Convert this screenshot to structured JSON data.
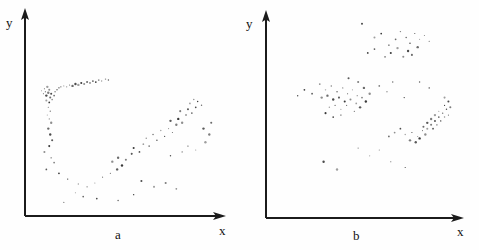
{
  "figure": {
    "background_color": "#fefefe",
    "ink_color": "#1b1b1b",
    "caption_a": "a",
    "caption_b": "b"
  },
  "panels": [
    {
      "id": "a",
      "caption": "a",
      "y_axis_label": "y",
      "x_axis_label": "x",
      "axis": {
        "origin_x": 25,
        "origin_y": 216,
        "x_end": 225,
        "y_end": 10
      }
    },
    {
      "id": "b",
      "caption": "b",
      "y_axis_label": "y",
      "x_axis_label": "x",
      "axis": {
        "origin_x": 26,
        "origin_y": 218,
        "x_end": 224,
        "y_end": 12
      }
    }
  ],
  "chart_data": [
    {
      "type": "scatter",
      "title": "a",
      "xlabel": "x",
      "ylabel": "y",
      "grid": false,
      "legend": "none",
      "axes_style": "arrow-axes-no-ticks",
      "xlim": [
        0,
        200
      ],
      "ylim": [
        0,
        206
      ],
      "description": "Sparse scattered points: a dense arching band in the upper-left rising to the right, plus a looser diagonal band of points in the lower-right quadrant.",
      "series": [
        {
          "name": "points",
          "points": [
            [
              17,
              129
            ],
            [
              19,
              126
            ],
            [
              20,
              131
            ],
            [
              21,
              128
            ],
            [
              22,
              124
            ],
            [
              23,
              133
            ],
            [
              24,
              127
            ],
            [
              25,
              130
            ],
            [
              26,
              122
            ],
            [
              27,
              126
            ],
            [
              22,
              119
            ],
            [
              25,
              117
            ],
            [
              28,
              120
            ],
            [
              30,
              124
            ],
            [
              31,
              128
            ],
            [
              33,
              130
            ],
            [
              35,
              132
            ],
            [
              37,
              133
            ],
            [
              40,
              134
            ],
            [
              43,
              133
            ],
            [
              46,
              135
            ],
            [
              49,
              134
            ],
            [
              52,
              136
            ],
            [
              55,
              135
            ],
            [
              58,
              137
            ],
            [
              61,
              136
            ],
            [
              64,
              138
            ],
            [
              67,
              137
            ],
            [
              70,
              139
            ],
            [
              73,
              138
            ],
            [
              76,
              140
            ],
            [
              79,
              139
            ],
            [
              83,
              141
            ],
            [
              86,
              140
            ],
            [
              24,
              112
            ],
            [
              26,
              108
            ],
            [
              23,
              104
            ],
            [
              25,
              100
            ],
            [
              27,
              96
            ],
            [
              24,
              90
            ],
            [
              26,
              84
            ],
            [
              28,
              78
            ],
            [
              25,
              72
            ],
            [
              20,
              66
            ],
            [
              27,
              60
            ],
            [
              30,
              55
            ],
            [
              22,
              48
            ],
            [
              35,
              44
            ],
            [
              44,
              38
            ],
            [
              55,
              33
            ],
            [
              64,
              30
            ],
            [
              72,
              34
            ],
            [
              80,
              40
            ],
            [
              88,
              44
            ],
            [
              95,
              48
            ],
            [
              100,
              52
            ],
            [
              90,
              56
            ],
            [
              96,
              60
            ],
            [
              104,
              58
            ],
            [
              110,
              64
            ],
            [
              112,
              70
            ],
            [
              118,
              66
            ],
            [
              122,
              74
            ],
            [
              128,
              72
            ],
            [
              125,
              80
            ],
            [
              132,
              84
            ],
            [
              136,
              78
            ],
            [
              140,
              88
            ],
            [
              144,
              82
            ],
            [
              148,
              90
            ],
            [
              152,
              86
            ],
            [
              156,
              94
            ],
            [
              150,
              98
            ],
            [
              158,
              100
            ],
            [
              162,
              96
            ],
            [
              166,
              104
            ],
            [
              160,
              108
            ],
            [
              168,
              110
            ],
            [
              172,
              106
            ],
            [
              176,
              112
            ],
            [
              170,
              116
            ],
            [
              178,
              118
            ],
            [
              174,
              120
            ],
            [
              182,
              114
            ],
            [
              150,
              62
            ],
            [
              162,
              66
            ],
            [
              168,
              72
            ],
            [
              176,
              68
            ],
            [
              186,
              76
            ],
            [
              190,
              84
            ],
            [
              184,
              90
            ],
            [
              192,
              96
            ],
            [
              120,
              36
            ],
            [
              133,
              30
            ],
            [
              145,
              34
            ],
            [
              156,
              28
            ],
            [
              60,
              20
            ],
            [
              74,
              18
            ],
            [
              96,
              16
            ],
            [
              112,
              22
            ],
            [
              40,
              14
            ],
            [
              52,
              24
            ]
          ]
        }
      ]
    },
    {
      "type": "scatter",
      "title": "b",
      "xlabel": "x",
      "ylabel": "y",
      "grid": false,
      "legend": "none",
      "axes_style": "arrow-axes-no-ticks",
      "xlim": [
        0,
        200
      ],
      "ylim": [
        0,
        206
      ],
      "description": "Sparse scattered points in three loose groupings: a diffuse patch top-right, a diagonal band through the middle-left, and a dense rising streak at the right-centre.",
      "series": [
        {
          "name": "points",
          "points": [
            [
              100,
              200
            ],
            [
              113,
              186
            ],
            [
              120,
              190
            ],
            [
              128,
              178
            ],
            [
              135,
              184
            ],
            [
              140,
              192
            ],
            [
              146,
              186
            ],
            [
              150,
              180
            ],
            [
              155,
              190
            ],
            [
              160,
              184
            ],
            [
              165,
              188
            ],
            [
              170,
              182
            ],
            [
              158,
              176
            ],
            [
              148,
              172
            ],
            [
              137,
              175
            ],
            [
              130,
              170
            ],
            [
              143,
              166
            ],
            [
              152,
              168
            ],
            [
              124,
              166
            ],
            [
              113,
              174
            ],
            [
              106,
              170
            ],
            [
              56,
              138
            ],
            [
              62,
              132
            ],
            [
              68,
              136
            ],
            [
              74,
              130
            ],
            [
              80,
              134
            ],
            [
              85,
              128
            ],
            [
              90,
              132
            ],
            [
              95,
              126
            ],
            [
              58,
              124
            ],
            [
              64,
              126
            ],
            [
              70,
              122
            ],
            [
              76,
              124
            ],
            [
              82,
              120
            ],
            [
              88,
              122
            ],
            [
              94,
              118
            ],
            [
              100,
              124
            ],
            [
              48,
              128
            ],
            [
              40,
              132
            ],
            [
              33,
              126
            ],
            [
              66,
              114
            ],
            [
              72,
              116
            ],
            [
              78,
              112
            ],
            [
              84,
              116
            ],
            [
              92,
              110
            ],
            [
              98,
              114
            ],
            [
              104,
              120
            ],
            [
              108,
              128
            ],
            [
              102,
              134
            ],
            [
              96,
              140
            ],
            [
              86,
              144
            ],
            [
              62,
              108
            ],
            [
              70,
              104
            ],
            [
              78,
              106
            ],
            [
              118,
              136
            ],
            [
              126,
              130
            ],
            [
              132,
              140
            ],
            [
              144,
              124
            ],
            [
              145,
              86
            ],
            [
              152,
              88
            ],
            [
              158,
              84
            ],
            [
              163,
              90
            ],
            [
              150,
              80
            ],
            [
              156,
              78
            ],
            [
              160,
              82
            ],
            [
              166,
              86
            ],
            [
              168,
              92
            ],
            [
              172,
              96
            ],
            [
              176,
              100
            ],
            [
              180,
              104
            ],
            [
              174,
              92
            ],
            [
              178,
              96
            ],
            [
              182,
              100
            ],
            [
              186,
              104
            ],
            [
              184,
              108
            ],
            [
              188,
              112
            ],
            [
              190,
              106
            ],
            [
              186,
              116
            ],
            [
              180,
              110
            ],
            [
              176,
              106
            ],
            [
              172,
              102
            ],
            [
              168,
              98
            ],
            [
              164,
              94
            ],
            [
              190,
              120
            ],
            [
              186,
              124
            ],
            [
              192,
              114
            ],
            [
              134,
              88
            ],
            [
              128,
              84
            ],
            [
              140,
              92
            ],
            [
              160,
              140
            ],
            [
              170,
              134
            ],
            [
              96,
              72
            ],
            [
              108,
              64
            ],
            [
              118,
              70
            ],
            [
              130,
              58
            ],
            [
              145,
              52
            ],
            [
              60,
              58
            ],
            [
              74,
              50
            ]
          ]
        }
      ]
    }
  ]
}
